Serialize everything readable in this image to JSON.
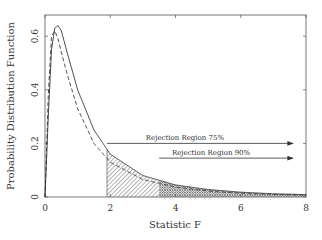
{
  "chart_data": {
    "type": "line",
    "title": "",
    "xlabel": "Statistic F",
    "ylabel": "Probability Distribution Function",
    "xlim": [
      0,
      8
    ],
    "ylim": [
      0,
      0.68
    ],
    "xticks": [
      0,
      2,
      4,
      6,
      8
    ],
    "yticks": [
      0,
      0.2,
      0.4,
      0.6
    ],
    "xtick_labels": [
      "0",
      "2",
      "4",
      "6",
      "8"
    ],
    "ytick_labels": [
      "0",
      "0.2",
      "0.4",
      "0.6"
    ],
    "grid": false,
    "series": [
      {
        "name": "F pdf (solid)",
        "style": "solid",
        "x": [
          0,
          0.1,
          0.2,
          0.3,
          0.4,
          0.5,
          0.7,
          1.0,
          1.5,
          2.0,
          3.0,
          4.0,
          5.0,
          6.0,
          7.0,
          8.0
        ],
        "y": [
          0,
          0.3,
          0.55,
          0.63,
          0.64,
          0.62,
          0.53,
          0.4,
          0.25,
          0.16,
          0.08,
          0.045,
          0.028,
          0.018,
          0.012,
          0.009
        ]
      },
      {
        "name": "F pdf (dashed)",
        "style": "dashed",
        "x": [
          0,
          0.1,
          0.2,
          0.3,
          0.4,
          0.5,
          0.7,
          1.0,
          1.5,
          2.0,
          3.0,
          4.0,
          5.0,
          6.0,
          7.0,
          8.0
        ],
        "y": [
          0,
          0.38,
          0.6,
          0.62,
          0.59,
          0.54,
          0.45,
          0.33,
          0.2,
          0.13,
          0.065,
          0.037,
          0.022,
          0.014,
          0.01,
          0.007
        ]
      }
    ],
    "shaded_regions": [
      {
        "name": "Rejection Region 75%",
        "x_from": 1.9,
        "x_to": 8,
        "pattern": "diagonal-hatch"
      },
      {
        "name": "Rejection Region 90%",
        "x_from": 3.5,
        "x_to": 8,
        "pattern": "cross-hatch"
      }
    ],
    "annotations": [
      {
        "text": "Rejection Region 75%",
        "arrow_from_x": 1.9,
        "arrow_to_x": 7.6,
        "y": 0.2
      },
      {
        "text": "Rejection Region 90%",
        "arrow_from_x": 3.5,
        "arrow_to_x": 7.6,
        "y": 0.145
      }
    ]
  }
}
